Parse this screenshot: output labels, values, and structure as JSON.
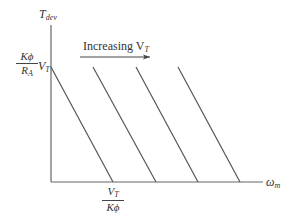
{
  "diagram": {
    "y_axis_label": {
      "main": "T",
      "sub": "dev"
    },
    "x_axis_label": {
      "main": "ω",
      "sub": "m"
    },
    "y_intercept_label": {
      "num": "Kϕ",
      "den": "R",
      "den_sub": "A",
      "suffix": "V",
      "suffix_sub": "T"
    },
    "x_intercept_label": {
      "num": "V",
      "num_sub": "T",
      "den": "Kϕ"
    },
    "annotation": {
      "text": "Increasing V",
      "sub": "T"
    },
    "lines": [
      {
        "x1": 51,
        "y1": 67,
        "x2": 113,
        "y2": 182
      },
      {
        "x1": 93,
        "y1": 67,
        "x2": 156,
        "y2": 182
      },
      {
        "x1": 136,
        "y1": 67,
        "x2": 198,
        "y2": 182
      },
      {
        "x1": 178,
        "y1": 67,
        "x2": 240,
        "y2": 182
      }
    ],
    "colors": {
      "axis": "#555555",
      "line": "#555555"
    }
  }
}
